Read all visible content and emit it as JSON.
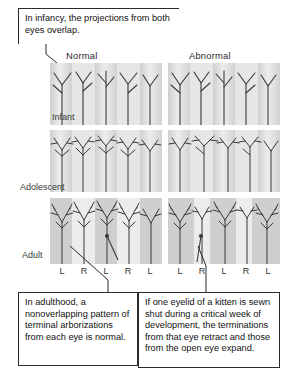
{
  "figure": {
    "title_callout": "In infancy, the projections from both eyes overlap.",
    "column_headers": [
      "Normal",
      "Abnormal"
    ],
    "row_labels": [
      "Infant",
      "Adolescent",
      "Adult"
    ],
    "axis_ticks": [
      "L",
      "R",
      "L",
      "R",
      "L"
    ],
    "callout_bottom_left": "In adulthood, a nonoverlapping pattern of terminal arborizations from each eye is normal.",
    "callout_bottom_right": "If one eyelid of a kitten is sewn shut during a critical week of development, the terminations from that eye retract and those from the open eye expand."
  },
  "colors": {
    "band_light": "#e8e8e8",
    "band_dark": "#c2c2c2",
    "ink": "#2b2b2b",
    "text": "#111111",
    "header_text": "#2a2a2a",
    "page_background": "#ffffff"
  },
  "icons": {
    "leader_line": "leader-line",
    "arrowhead": "arrowhead-icon"
  }
}
